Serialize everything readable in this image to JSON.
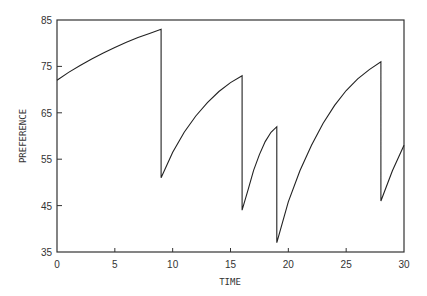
{
  "chart_data": {
    "type": "line",
    "title": "",
    "xlabel": "TIME",
    "ylabel": "PREFERENCE",
    "xlim": [
      0,
      30
    ],
    "ylim": [
      35,
      85
    ],
    "xticks": [
      0,
      5,
      10,
      15,
      20,
      25,
      30
    ],
    "yticks": [
      35,
      45,
      55,
      65,
      75,
      85
    ],
    "grid": false,
    "legend": null,
    "series": [
      {
        "name": "preference",
        "points": [
          [
            0,
            72
          ],
          [
            1,
            73.7
          ],
          [
            2,
            75.2
          ],
          [
            3,
            76.6
          ],
          [
            4,
            77.9
          ],
          [
            5,
            79.1
          ],
          [
            6,
            80.2
          ],
          [
            7,
            81.2
          ],
          [
            8,
            82.1
          ],
          [
            9,
            83
          ],
          [
            9,
            51
          ],
          [
            10,
            56.5
          ],
          [
            11,
            60.8
          ],
          [
            12,
            64.3
          ],
          [
            13,
            67.2
          ],
          [
            14,
            69.6
          ],
          [
            15,
            71.5
          ],
          [
            16,
            73
          ],
          [
            16,
            44
          ],
          [
            16.5,
            48.3
          ],
          [
            17,
            52.6
          ],
          [
            17.5,
            56
          ],
          [
            18,
            58.8
          ],
          [
            18.5,
            60.8
          ],
          [
            19,
            62
          ],
          [
            19,
            37
          ],
          [
            20,
            45.8
          ],
          [
            21,
            52.5
          ],
          [
            22,
            58
          ],
          [
            23,
            62.7
          ],
          [
            24,
            66.6
          ],
          [
            25,
            69.8
          ],
          [
            26,
            72.3
          ],
          [
            27,
            74.3
          ],
          [
            28,
            76
          ],
          [
            28,
            46
          ],
          [
            29,
            52.5
          ],
          [
            30,
            58
          ]
        ]
      }
    ]
  }
}
